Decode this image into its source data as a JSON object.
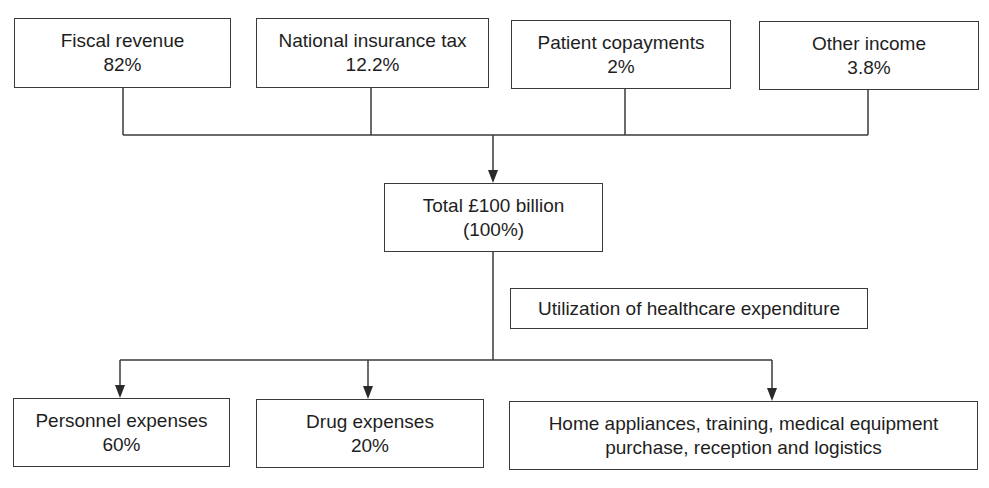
{
  "diagram": {
    "sources": [
      {
        "label": "Fiscal revenue",
        "value": "82%"
      },
      {
        "label": "National insurance tax",
        "value": "12.2%"
      },
      {
        "label": "Patient copayments",
        "value": "2%"
      },
      {
        "label": "Other income",
        "value": "3.8%"
      }
    ],
    "total": {
      "label": "Total £100 billion",
      "value": "(100%)"
    },
    "utilization_label": "Utilization of healthcare expenditure",
    "uses": [
      {
        "label": "Personnel expenses",
        "value": "60%"
      },
      {
        "label": "Drug expenses",
        "value": "20%"
      },
      {
        "label": "Home appliances, training, medical equipment",
        "value": "purchase, reception and logistics"
      }
    ],
    "colors": {
      "line": "#3a3a3a",
      "text": "#1e1e1e",
      "background": "#ffffff"
    }
  }
}
